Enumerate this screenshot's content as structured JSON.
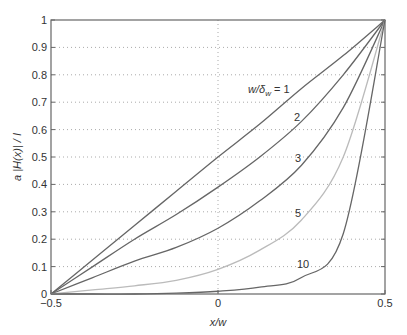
{
  "chart_data": {
    "type": "line",
    "title": "",
    "xlabel": "x/w",
    "ylabel": "a |H(x)| / I",
    "xlim": [
      -0.5,
      0.5
    ],
    "ylim": [
      0,
      1
    ],
    "grid": "dotted",
    "xticks": [
      "-0.5",
      "0",
      "0.5"
    ],
    "yticks": [
      "0",
      "0.1",
      "0.2",
      "0.3",
      "0.4",
      "0.5",
      "0.6",
      "0.7",
      "0.8",
      "0.9",
      "1"
    ],
    "x": [
      -0.5,
      -0.375,
      -0.25,
      -0.125,
      0,
      0.125,
      0.25,
      0.375,
      0.5
    ],
    "series": [
      {
        "name": "w/δw = 1",
        "label": "w/δw = 1",
        "color": "#666666",
        "values": [
          0,
          0.125,
          0.25,
          0.375,
          0.5,
          0.62,
          0.75,
          0.87,
          1
        ]
      },
      {
        "name": "2",
        "label": "2",
        "color": "#666666",
        "values": [
          0,
          0.1,
          0.2,
          0.29,
          0.39,
          0.5,
          0.63,
          0.8,
          1
        ]
      },
      {
        "name": "3",
        "label": "3",
        "color": "#666666",
        "values": [
          0,
          0.06,
          0.12,
          0.17,
          0.24,
          0.34,
          0.47,
          0.68,
          1
        ]
      },
      {
        "name": "5",
        "label": "5",
        "color": "#bbbbbb",
        "values": [
          0,
          0.015,
          0.03,
          0.05,
          0.09,
          0.16,
          0.27,
          0.5,
          1
        ]
      },
      {
        "name": "10",
        "label": "10",
        "color": "#666666",
        "values": [
          0,
          0.0,
          0.0,
          0.003,
          0.01,
          0.025,
          0.06,
          0.22,
          1
        ]
      }
    ]
  },
  "labels": {
    "curve_1_prefix": "w/δ",
    "curve_1_sub": "w",
    "curve_1_suffix": " = 1",
    "curve_2": "2",
    "curve_3": "3",
    "curve_5": "5",
    "curve_10": "10"
  }
}
